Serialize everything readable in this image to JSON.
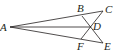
{
  "diagram": {
    "type": "geometry",
    "points": {
      "A": {
        "label": "A",
        "x": 10,
        "y": 27
      },
      "B": {
        "label": "B",
        "x": 82,
        "y": 16
      },
      "C": {
        "label": "C",
        "x": 103,
        "y": 11
      },
      "D": {
        "label": "D",
        "x": 91,
        "y": 27
      },
      "E": {
        "label": "E",
        "x": 103,
        "y": 43
      },
      "F": {
        "label": "F",
        "x": 81,
        "y": 39
      }
    },
    "segments": [
      [
        "A",
        "C"
      ],
      [
        "A",
        "E"
      ],
      [
        "A",
        "D"
      ],
      [
        "B",
        "E"
      ],
      [
        "F",
        "C"
      ]
    ],
    "colors": {
      "ink": "#231f20",
      "background": "#ffffff"
    }
  }
}
